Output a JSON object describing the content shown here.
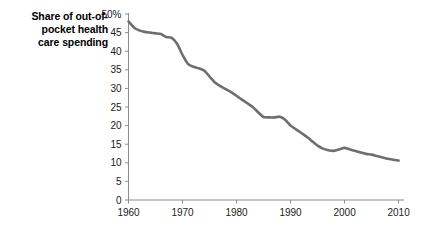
{
  "chart_data": {
    "type": "line",
    "title_lines": [
      "Share of out-of-",
      "pocket health",
      "care spending"
    ],
    "xlabel": "",
    "ylabel": "",
    "xlim": [
      1960,
      2011
    ],
    "ylim": [
      0,
      50
    ],
    "grid": false,
    "legend": false,
    "line_color": "#6e6e6e",
    "axis_color": "#8c8c8c",
    "y_ticks": [
      "0",
      "5",
      "10",
      "15",
      "20",
      "25",
      "30",
      "35",
      "40",
      "45",
      "50%"
    ],
    "y_tick_values": [
      0,
      5,
      10,
      15,
      20,
      25,
      30,
      35,
      40,
      45,
      50
    ],
    "x_ticks": [
      "1960",
      "1970",
      "1980",
      "1990",
      "2000",
      "2010"
    ],
    "x_tick_values": [
      1960,
      1970,
      1980,
      1990,
      2000,
      2010
    ],
    "series": [
      {
        "name": "Share of out-of-pocket health care spending",
        "x": [
          1960,
          1961,
          1962,
          1963,
          1964,
          1965,
          1966,
          1967,
          1968,
          1969,
          1970,
          1971,
          1972,
          1973,
          1974,
          1975,
          1976,
          1977,
          1978,
          1979,
          1980,
          1981,
          1982,
          1983,
          1984,
          1985,
          1986,
          1987,
          1988,
          1989,
          1990,
          1991,
          1992,
          1993,
          1994,
          1995,
          1996,
          1997,
          1998,
          1999,
          2000,
          2001,
          2002,
          2003,
          2004,
          2005,
          2006,
          2007,
          2008,
          2009,
          2010
        ],
        "values": [
          48.0,
          46.4,
          45.6,
          45.2,
          45.0,
          44.8,
          44.6,
          43.8,
          43.6,
          42.0,
          39.0,
          36.6,
          35.8,
          35.4,
          34.8,
          33.2,
          31.6,
          30.6,
          29.8,
          29.0,
          28.0,
          27.0,
          26.0,
          25.0,
          23.6,
          22.3,
          22.2,
          22.2,
          22.4,
          21.6,
          20.0,
          19.0,
          18.0,
          17.0,
          15.8,
          14.6,
          13.8,
          13.4,
          13.2,
          13.6,
          14.0,
          13.6,
          13.2,
          12.8,
          12.4,
          12.2,
          11.8,
          11.4,
          11.1,
          10.8,
          10.6
        ]
      }
    ]
  }
}
